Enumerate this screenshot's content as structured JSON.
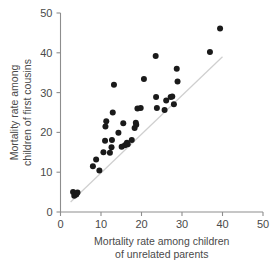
{
  "chart_data": {
    "type": "scatter",
    "title": "",
    "xlabel": "Mortality rate among children of unrelated parents",
    "xlabel_lines": [
      "Mortality rate among children",
      "of unrelated parents"
    ],
    "ylabel": "Mortality rate among children of first cousins",
    "ylabel_lines": [
      "Mortality rate among",
      "children of first cousins"
    ],
    "xlim": [
      0,
      50
    ],
    "ylim": [
      0,
      50
    ],
    "xticks": [
      0,
      10,
      20,
      30,
      40,
      50
    ],
    "yticks": [
      0,
      10,
      20,
      30,
      40,
      50
    ],
    "xticklabels": [
      "0",
      "10",
      "20",
      "30",
      "40",
      "50"
    ],
    "yticklabels": [
      "0",
      "10",
      "20",
      "30",
      "40",
      "50"
    ],
    "grid": false,
    "legend": null,
    "point_color": "#1a1a1a",
    "point_size": 3.0,
    "reference_line": {
      "type": "identity",
      "label": "y = x",
      "color": "#cfcfcf",
      "x_start": 2.5,
      "y_start": 2.5,
      "x_end": 40.0,
      "y_end": 39.0
    },
    "points": [
      {
        "x": 3.1,
        "y": 5.0
      },
      {
        "x": 3.4,
        "y": 4.1
      },
      {
        "x": 3.9,
        "y": 4.4
      },
      {
        "x": 4.2,
        "y": 4.9
      },
      {
        "x": 8.0,
        "y": 11.5
      },
      {
        "x": 8.8,
        "y": 13.2
      },
      {
        "x": 9.6,
        "y": 10.4
      },
      {
        "x": 10.6,
        "y": 15.0
      },
      {
        "x": 11.0,
        "y": 17.9
      },
      {
        "x": 11.1,
        "y": 21.5
      },
      {
        "x": 11.3,
        "y": 22.8
      },
      {
        "x": 12.2,
        "y": 14.9
      },
      {
        "x": 12.6,
        "y": 16.3
      },
      {
        "x": 12.7,
        "y": 18.1
      },
      {
        "x": 12.9,
        "y": 25.0
      },
      {
        "x": 13.2,
        "y": 32.0
      },
      {
        "x": 14.3,
        "y": 19.9
      },
      {
        "x": 15.1,
        "y": 16.4
      },
      {
        "x": 15.5,
        "y": 22.3
      },
      {
        "x": 15.9,
        "y": 16.8
      },
      {
        "x": 16.4,
        "y": 17.4
      },
      {
        "x": 16.6,
        "y": 17.0
      },
      {
        "x": 17.6,
        "y": 18.1
      },
      {
        "x": 18.3,
        "y": 21.1
      },
      {
        "x": 18.6,
        "y": 22.4
      },
      {
        "x": 18.7,
        "y": 21.9
      },
      {
        "x": 19.0,
        "y": 26.0
      },
      {
        "x": 19.8,
        "y": 26.1
      },
      {
        "x": 20.6,
        "y": 33.4
      },
      {
        "x": 23.5,
        "y": 39.2
      },
      {
        "x": 23.6,
        "y": 28.9
      },
      {
        "x": 23.8,
        "y": 26.1
      },
      {
        "x": 25.7,
        "y": 25.6
      },
      {
        "x": 26.1,
        "y": 28.0
      },
      {
        "x": 27.2,
        "y": 28.9
      },
      {
        "x": 27.6,
        "y": 29.0
      },
      {
        "x": 28.0,
        "y": 27.1
      },
      {
        "x": 28.7,
        "y": 36.0
      },
      {
        "x": 28.9,
        "y": 32.8
      },
      {
        "x": 36.9,
        "y": 40.2
      },
      {
        "x": 39.4,
        "y": 46.1
      }
    ]
  }
}
